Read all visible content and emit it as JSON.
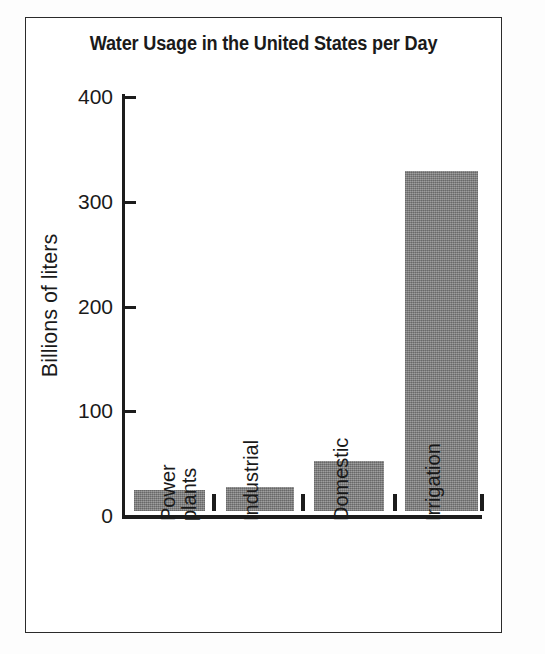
{
  "figure": {
    "title": "Water Usage in the United States per Day",
    "border_color": "#2b2b2b",
    "background": "#ffffff"
  },
  "axes": {
    "y_title": "Billions of liters",
    "y_ticks": [
      "400",
      "300",
      "200",
      "100",
      "0"
    ],
    "x_categories": [
      {
        "line1": "Power",
        "line2": "plants"
      },
      {
        "line1": "Industrial",
        "line2": ""
      },
      {
        "line1": "Domestic",
        "line2": ""
      },
      {
        "line1": "Irrigation",
        "line2": ""
      }
    ]
  },
  "chart_data": {
    "type": "bar",
    "title": "Water Usage in the United States per Day",
    "xlabel": "",
    "ylabel": "Billions of liters",
    "categories": [
      "Power plants",
      "Industrial",
      "Domestic",
      "Irrigation"
    ],
    "values": [
      20,
      23,
      48,
      325
    ],
    "ylim": [
      0,
      400
    ],
    "yticks": [
      0,
      100,
      200,
      300,
      400
    ],
    "grid": false,
    "legend": "none",
    "bar_color": "#8a8a8a",
    "units": "billions of liters per day"
  }
}
